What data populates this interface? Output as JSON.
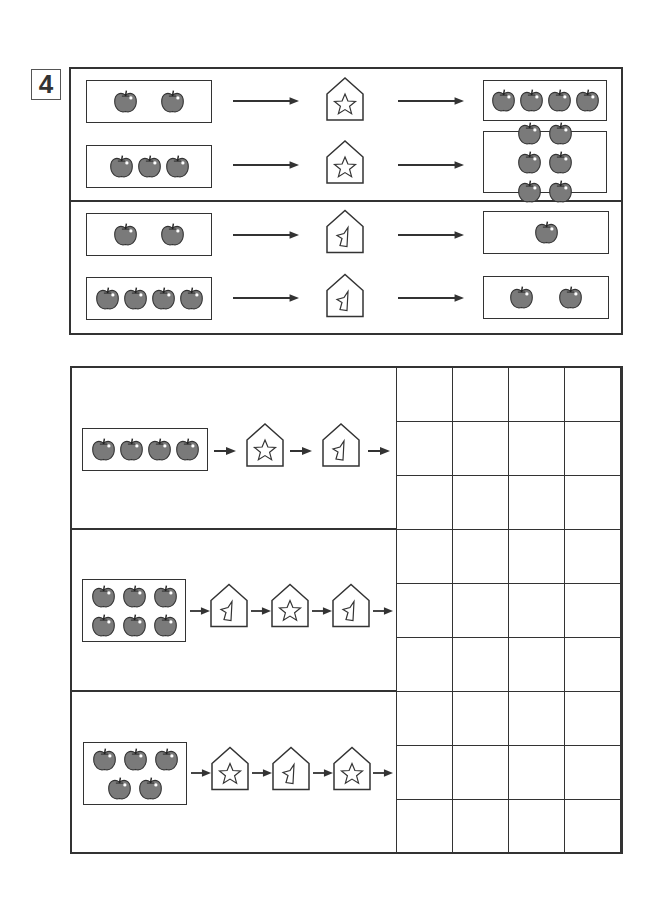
{
  "exercise_number": "4",
  "colors": {
    "apple_fill": "#7a7a7a",
    "line": "#333333",
    "background": "#ffffff"
  },
  "examples": {
    "star_rule": [
      {
        "input_apples": 2,
        "machine": "star",
        "output_apples": 4
      },
      {
        "input_apples": 3,
        "machine": "star",
        "output_apples": 6
      }
    ],
    "broken_rule": [
      {
        "input_apples": 2,
        "machine": "broken-star",
        "output_apples": 1
      },
      {
        "input_apples": 4,
        "machine": "broken-star",
        "output_apples": 2
      }
    ]
  },
  "tasks": [
    {
      "input_apples": 4,
      "machines": [
        "star",
        "broken-star"
      ],
      "answer_rows": 3,
      "answer_cols": 4
    },
    {
      "input_apples": 6,
      "machines": [
        "broken-star",
        "star",
        "broken-star"
      ],
      "answer_rows": 3,
      "answer_cols": 4
    },
    {
      "input_apples": 5,
      "machines": [
        "star",
        "broken-star",
        "star"
      ],
      "answer_rows": 3,
      "answer_cols": 4
    }
  ]
}
